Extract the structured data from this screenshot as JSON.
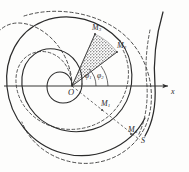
{
  "figure": {
    "kind": "archimedean-spiral-diagram",
    "background_color": "#fdfdfc",
    "ink_color": "#2b2b2b",
    "axis": {
      "label": "x",
      "direction": "horizontal-right",
      "has_arrow": true,
      "y_position": 86
    },
    "origin": {
      "label": "O",
      "x": 72,
      "y": 86
    },
    "points": [
      {
        "name": "M-sub-3",
        "label": "M",
        "subscript": "3",
        "x": 97,
        "y": 31
      },
      {
        "name": "M-sub-2",
        "label": "M",
        "subscript": "2",
        "x": 115,
        "y": 49
      },
      {
        "name": "M-sub-1",
        "label": "M",
        "subscript": "1",
        "x": 104,
        "y": 104
      },
      {
        "name": "M-sub-4",
        "label": "M",
        "subscript": "4",
        "x": 133,
        "y": 131
      }
    ],
    "angles": [
      {
        "name": "angle-phi-1",
        "label": "φ",
        "subscript": "1",
        "x": 87,
        "y": 77
      },
      {
        "name": "angle-phi-2",
        "label": "φ",
        "subscript": "2",
        "x": 98,
        "y": 77
      }
    ],
    "curve_label": {
      "name": "curve-label-s",
      "label": "S",
      "x": 143,
      "y": 143
    },
    "sector": {
      "name": "shaded-sector",
      "fill": "#8f8f8f",
      "hatch": "dotted",
      "description": "shaded sector between rays to M3 and M2"
    },
    "curves": [
      {
        "name": "inner-spiral-solid",
        "style": "solid"
      },
      {
        "name": "middle-spiral-solid",
        "style": "solid"
      },
      {
        "name": "outer-spiral-solid",
        "style": "solid"
      },
      {
        "name": "inner-spiral-dashed",
        "style": "dashed"
      },
      {
        "name": "outer-spiral-dashed",
        "style": "dashed"
      },
      {
        "name": "right-arc-solid",
        "style": "solid"
      }
    ],
    "rays": [
      {
        "name": "ray-to-M3",
        "style": "solid"
      },
      {
        "name": "ray-to-M2",
        "style": "solid"
      },
      {
        "name": "ray-to-M1-M4",
        "style": "dashed"
      }
    ]
  }
}
